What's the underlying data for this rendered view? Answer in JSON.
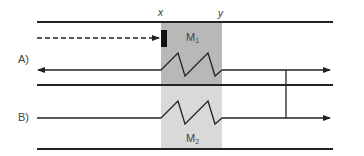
{
  "diagram": {
    "rows": [
      {
        "label": "A)",
        "region_label": "M",
        "region_sub": "1",
        "region_color": "#b8b8b8"
      },
      {
        "label": "B)",
        "region_label": "M",
        "region_sub": "2",
        "region_color": "#d9d9d9"
      }
    ],
    "markers": {
      "left": "x",
      "right": "y"
    },
    "colors": {
      "line": "#222222",
      "block": "#111111",
      "text": "#444444"
    }
  }
}
